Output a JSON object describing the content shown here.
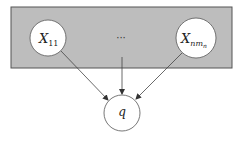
{
  "diagram": {
    "plate": {
      "x": 11,
      "y": 7,
      "w": 221,
      "h": 61,
      "fill": "#bdbdbd",
      "stroke": "#555555"
    },
    "nodes": [
      {
        "id": "x11",
        "label": "X",
        "sub": "11",
        "cx": 48,
        "cy": 38,
        "r": 18
      },
      {
        "id": "xn",
        "label": "X",
        "sub": "nm",
        "subsub": "n",
        "cx": 196,
        "cy": 38,
        "r": 20
      },
      {
        "id": "q",
        "label": "q",
        "cx": 122,
        "cy": 113,
        "r": 18
      }
    ],
    "ellipsis": "···",
    "edges": [
      {
        "from": "x11",
        "to": "q"
      },
      {
        "from": "ellipsis",
        "to": "q"
      },
      {
        "from": "xn",
        "to": "q"
      }
    ]
  }
}
